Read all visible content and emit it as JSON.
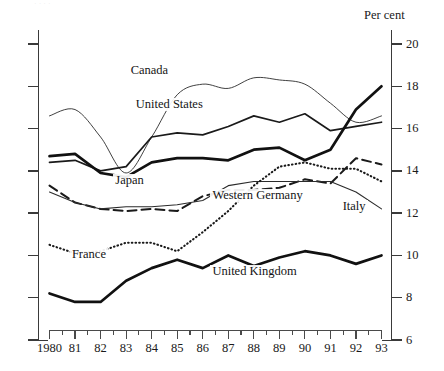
{
  "figure": {
    "percent_label": "Per cent",
    "ghost_caption": "·  ·   ·      ·"
  },
  "chart_data": {
    "type": "line",
    "title": "",
    "subtitle": "",
    "xlabel": "",
    "ylabel": "Per cent",
    "ylim": [
      6,
      20
    ],
    "xlim": [
      1980,
      1993
    ],
    "grid": false,
    "legend": "inline-labels",
    "yticks": [
      20,
      18,
      16,
      14,
      12,
      10,
      8,
      6
    ],
    "ytick_labels": [
      "20",
      "18",
      "16",
      "14",
      "12",
      "10",
      "8",
      "6"
    ],
    "x": [
      1980,
      1981,
      1982,
      1983,
      1984,
      1985,
      1986,
      1987,
      1988,
      1989,
      1990,
      1991,
      1992,
      1993
    ],
    "xtick_labels": [
      "1980",
      "81",
      "82",
      "83",
      "84",
      "85",
      "86",
      "87",
      "88",
      "89",
      "90",
      "91",
      "92",
      "93"
    ],
    "minor_ticks": "half-year",
    "series": [
      {
        "name": "Canada",
        "style": "thin-solid",
        "color": "#2b2b2b",
        "width": 0.9,
        "label_x": 1983.1,
        "label_y": 18.7,
        "values": [
          16.6,
          16.9,
          15.6,
          13.9,
          15.6,
          17.6,
          18.1,
          17.9,
          18.4,
          18.3,
          18.1,
          17.2,
          16.3,
          16.6
        ]
      },
      {
        "name": "United States",
        "style": "medium-solid",
        "color": "#1a1a1a",
        "width": 1.7,
        "label_x": 1983.3,
        "label_y": 17.1,
        "values": [
          14.4,
          14.5,
          14.0,
          14.2,
          15.6,
          15.8,
          15.7,
          16.1,
          16.6,
          16.3,
          16.7,
          15.9,
          16.1,
          16.3
        ]
      },
      {
        "name": "Japan",
        "style": "thick-solid",
        "color": "#111111",
        "width": 2.7,
        "label_x": 1982.5,
        "label_y": 13.5,
        "values": [
          14.7,
          14.8,
          13.9,
          13.7,
          14.4,
          14.6,
          14.6,
          14.5,
          15.0,
          15.1,
          14.5,
          15.0,
          16.9,
          18.0
        ]
      },
      {
        "name": "Western Germany",
        "style": "dashed",
        "color": "#1a1a1a",
        "width": 2.0,
        "label_x": 1986.3,
        "label_y": 12.8,
        "values": [
          13.3,
          12.5,
          12.2,
          12.1,
          12.2,
          12.1,
          12.8,
          13.1,
          13.1,
          13.2,
          13.6,
          13.4,
          14.6,
          14.3
        ]
      },
      {
        "name": "Italy",
        "style": "thin-solid",
        "color": "#2b2b2b",
        "width": 1.1,
        "label_x": 1991.4,
        "label_y": 12.3,
        "values": [
          13.0,
          12.5,
          12.2,
          12.3,
          12.3,
          12.4,
          12.6,
          13.3,
          13.5,
          13.5,
          13.5,
          13.5,
          13.0,
          12.2
        ]
      },
      {
        "name": "France",
        "style": "dotted",
        "color": "#1a1a1a",
        "width": 2.1,
        "label_x": 1980.8,
        "label_y": 10.0,
        "values": [
          10.5,
          10.1,
          10.2,
          10.6,
          10.6,
          10.2,
          11.1,
          12.1,
          13.3,
          14.2,
          14.4,
          14.1,
          14.1,
          13.5
        ]
      },
      {
        "name": "United Kingdom",
        "style": "thick-solid",
        "color": "#111111",
        "label_x": 1986.3,
        "label_y": 9.2,
        "width": 2.7,
        "values": [
          8.2,
          7.8,
          7.8,
          8.8,
          9.4,
          9.8,
          9.4,
          10.0,
          9.5,
          9.9,
          10.2,
          10.0,
          9.6,
          10.0
        ]
      }
    ]
  }
}
